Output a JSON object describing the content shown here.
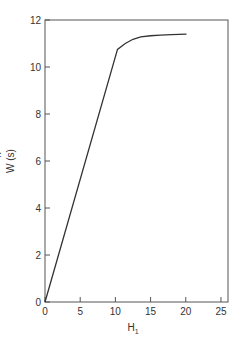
{
  "chart_data": {
    "type": "line",
    "title": "",
    "xlabel": "H",
    "xlabel_subscript": "1",
    "ylabel": "W (s)",
    "ylabel_hat_char": "^",
    "xlim": [
      0,
      26
    ],
    "ylim": [
      0,
      12
    ],
    "xticks": [
      0,
      5,
      10,
      15,
      20,
      25
    ],
    "yticks": [
      0,
      2,
      4,
      6,
      8,
      10,
      12
    ],
    "xtick_labels": [
      "0",
      "5",
      "10",
      "15",
      "20",
      "25"
    ],
    "ytick_labels": [
      "0",
      "2",
      "4",
      "6",
      "8",
      "10",
      "12"
    ],
    "grid": false,
    "legend": null,
    "series": [
      {
        "name": "W(s-hat)",
        "x": [
          0,
          10.3,
          11.4,
          12.5,
          13.6,
          15.0,
          16.4,
          18.0,
          20.1
        ],
        "y": [
          0,
          10.75,
          11.0,
          11.18,
          11.28,
          11.33,
          11.36,
          11.38,
          11.4
        ]
      }
    ],
    "colors": {
      "line": "#333333",
      "axis": "#555555"
    }
  }
}
